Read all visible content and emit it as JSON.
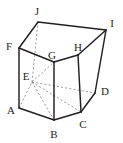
{
  "figure": {
    "type": "pentagonal-prism",
    "background_color": "#ffffff",
    "solid_edge_color": "#231f20",
    "hidden_edge_color": "#8a8a8a",
    "label_color": "#231f20",
    "canvas": {
      "width": 123,
      "height": 143
    },
    "vertices": [
      {
        "id": "A",
        "label": "A",
        "x": 19,
        "y": 108,
        "label_x": 11,
        "label_y": 110,
        "hidden": false
      },
      {
        "id": "B",
        "label": "B",
        "x": 54,
        "y": 120,
        "label_x": 54,
        "label_y": 134,
        "hidden": false
      },
      {
        "id": "C",
        "label": "C",
        "x": 81,
        "y": 112,
        "label_x": 83,
        "label_y": 124,
        "hidden": false
      },
      {
        "id": "D",
        "label": "D",
        "x": 95,
        "y": 93,
        "label_x": 105,
        "label_y": 91,
        "hidden": false
      },
      {
        "id": "E",
        "label": "E",
        "x": 32,
        "y": 82,
        "label_x": 26,
        "label_y": 76,
        "hidden": true
      },
      {
        "id": "F",
        "label": "F",
        "x": 19,
        "y": 48,
        "label_x": 9,
        "label_y": 46,
        "hidden": false
      },
      {
        "id": "G",
        "label": "G",
        "x": 54,
        "y": 62,
        "label_x": 52,
        "label_y": 55,
        "hidden": false
      },
      {
        "id": "H",
        "label": "H",
        "x": 78,
        "y": 55,
        "label_x": 78,
        "label_y": 47,
        "hidden": false
      },
      {
        "id": "I",
        "label": "I",
        "x": 106,
        "y": 30,
        "label_x": 112,
        "label_y": 23,
        "hidden": false
      },
      {
        "id": "J",
        "label": "J",
        "x": 38,
        "y": 22,
        "label_x": 37,
        "label_y": 11,
        "hidden": false
      }
    ],
    "solid_edges": [
      {
        "from": "A",
        "to": "B",
        "name": "edge-A-B"
      },
      {
        "from": "B",
        "to": "C",
        "name": "edge-B-C"
      },
      {
        "from": "C",
        "to": "D",
        "name": "edge-C-D"
      },
      {
        "from": "F",
        "to": "J",
        "name": "edge-F-J"
      },
      {
        "from": "J",
        "to": "I",
        "name": "edge-J-I"
      },
      {
        "from": "I",
        "to": "H",
        "name": "edge-I-H"
      },
      {
        "from": "H",
        "to": "G",
        "name": "edge-H-G"
      },
      {
        "from": "G",
        "to": "F",
        "name": "edge-G-F"
      },
      {
        "from": "A",
        "to": "F",
        "name": "edge-A-F"
      },
      {
        "from": "B",
        "to": "G",
        "name": "edge-B-G"
      },
      {
        "from": "C",
        "to": "H",
        "name": "edge-C-H"
      },
      {
        "from": "D",
        "to": "I",
        "name": "edge-D-I"
      }
    ],
    "hidden_edges": [
      {
        "from": "A",
        "to": "E",
        "name": "edge-A-E"
      },
      {
        "from": "E",
        "to": "D",
        "name": "edge-E-D"
      },
      {
        "from": "E",
        "to": "J",
        "name": "edge-E-J"
      },
      {
        "from": "E",
        "to": "B",
        "name": "edge-E-B"
      },
      {
        "from": "E",
        "to": "G",
        "name": "edge-E-G"
      },
      {
        "from": "E",
        "to": "C",
        "name": "edge-E-C"
      }
    ]
  }
}
